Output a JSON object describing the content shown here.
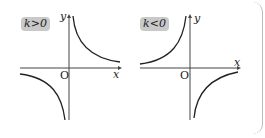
{
  "panels": [
    {
      "label": "k>0",
      "y_axis": "y",
      "x_axis": "x",
      "origin": "O"
    },
    {
      "label": "k<0",
      "y_axis": "y",
      "x_axis": "x",
      "origin": "O"
    }
  ],
  "colors": {
    "curve": "#222222",
    "axis": "#444444",
    "badge_bg": "#c9c9c9"
  }
}
